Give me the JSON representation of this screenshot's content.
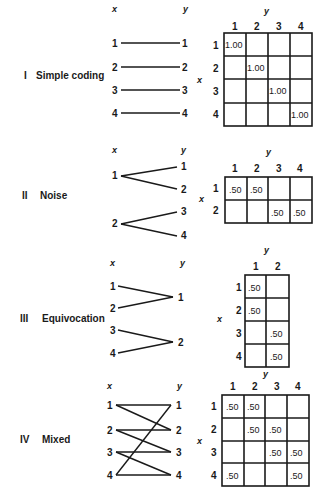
{
  "sections": [
    {
      "numeral": "I",
      "title": "Simple coding",
      "x_axis": "x",
      "y_axis": "y",
      "x_nodes": [
        "1",
        "2",
        "3",
        "4"
      ],
      "y_nodes": [
        "1",
        "2",
        "3",
        "4"
      ],
      "edges": [
        [
          1,
          1
        ],
        [
          2,
          2
        ],
        [
          3,
          3
        ],
        [
          4,
          4
        ]
      ],
      "matrix": {
        "row_label": "x",
        "col_label": "y",
        "rows": [
          "1",
          "2",
          "3",
          "4"
        ],
        "cols": [
          "1",
          "2",
          "3",
          "4"
        ],
        "cells": [
          [
            "1.00",
            "",
            "",
            ""
          ],
          [
            "",
            "1.00",
            "",
            ""
          ],
          [
            "",
            "",
            "1.00",
            ""
          ],
          [
            "",
            "",
            "",
            "1.00"
          ]
        ]
      }
    },
    {
      "numeral": "II",
      "title": "Noise",
      "x_axis": "x",
      "y_axis": "y",
      "x_nodes": [
        "1",
        "2"
      ],
      "y_nodes": [
        "1",
        "2",
        "3",
        "4"
      ],
      "edges": [
        [
          1,
          1
        ],
        [
          1,
          2
        ],
        [
          2,
          3
        ],
        [
          2,
          4
        ]
      ],
      "matrix": {
        "row_label": "x",
        "col_label": "y",
        "rows": [
          "1",
          "2"
        ],
        "cols": [
          "1",
          "2",
          "3",
          "4"
        ],
        "cells": [
          [
            ".50",
            ".50",
            "",
            ""
          ],
          [
            "",
            "",
            ".50",
            ".50"
          ]
        ]
      }
    },
    {
      "numeral": "III",
      "title": "Equivocation",
      "x_axis": "x",
      "y_axis": "y",
      "x_nodes": [
        "1",
        "2",
        "3",
        "4"
      ],
      "y_nodes": [
        "1",
        "2"
      ],
      "edges": [
        [
          1,
          1
        ],
        [
          2,
          1
        ],
        [
          3,
          2
        ],
        [
          4,
          2
        ]
      ],
      "matrix": {
        "row_label": "x",
        "col_label": "y",
        "rows": [
          "1",
          "2",
          "3",
          "4"
        ],
        "cols": [
          "1",
          "2"
        ],
        "cells": [
          [
            ".50",
            ""
          ],
          [
            ".50",
            ""
          ],
          [
            "",
            ".50"
          ],
          [
            "",
            ".50"
          ]
        ]
      }
    },
    {
      "numeral": "IV",
      "title": "Mixed",
      "x_axis": "x",
      "y_axis": "y",
      "x_nodes": [
        "1",
        "2",
        "3",
        "4"
      ],
      "y_nodes": [
        "1",
        "2",
        "3",
        "4"
      ],
      "edges": [
        [
          1,
          1
        ],
        [
          1,
          2
        ],
        [
          2,
          2
        ],
        [
          2,
          3
        ],
        [
          3,
          3
        ],
        [
          3,
          4
        ],
        [
          4,
          4
        ],
        [
          4,
          1
        ]
      ],
      "matrix": {
        "row_label": "x",
        "col_label": "y",
        "rows": [
          "1",
          "2",
          "3",
          "4"
        ],
        "cols": [
          "1",
          "2",
          "3",
          "4"
        ],
        "cells": [
          [
            ".50",
            ".50",
            "",
            ""
          ],
          [
            "",
            ".50",
            ".50",
            ""
          ],
          [
            "",
            "",
            ".50",
            ".50"
          ],
          [
            ".50",
            "",
            "",
            ".50"
          ]
        ]
      }
    }
  ]
}
